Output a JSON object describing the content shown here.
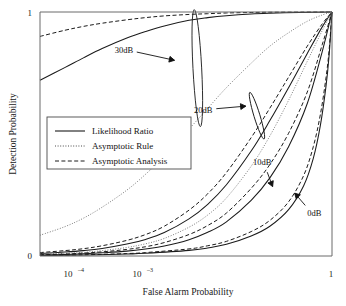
{
  "chart_data": {
    "type": "line",
    "title": "",
    "xlabel": "False Alarm Probability",
    "ylabel": "Detection Probability",
    "xscale": "log",
    "yscale": "linear",
    "xlim": [
      2e-05,
      1
    ],
    "ylim": [
      0,
      1
    ],
    "grid": false,
    "xticks": [
      {
        "value": 0.0001,
        "label": "10",
        "exponent": "–4"
      },
      {
        "value": 0.001,
        "label": "10",
        "exponent": "–3"
      },
      {
        "value": 1,
        "label": "1",
        "exponent": ""
      }
    ],
    "yticks": [
      {
        "value": 0,
        "label": "0"
      },
      {
        "value": 1,
        "label": "1"
      }
    ],
    "legend": {
      "position": "center-left",
      "entries": [
        {
          "name": "Likelihood Ratio",
          "style": "solid"
        },
        {
          "name": "Asymptotic Rule",
          "style": "dotted"
        },
        {
          "name": "Asymptotic Analysis",
          "style": "dashed"
        }
      ]
    },
    "annotations": [
      {
        "text": "30dB",
        "x": 0.00045,
        "y": 0.845,
        "target_x": 0.0032,
        "target_y": 0.8
      },
      {
        "text": "20dB",
        "x": 0.0085,
        "y": 0.6,
        "target_x": 0.045,
        "target_y": 0.615
      },
      {
        "text": "10dB",
        "x": 0.075,
        "y": 0.385,
        "target_x": 0.115,
        "target_y": 0.275
      },
      {
        "text": "0dB",
        "x": 0.52,
        "y": 0.175,
        "target_x": 0.235,
        "target_y": 0.265
      }
    ],
    "markers": [
      {
        "kind": "ellipse",
        "label_for": "30dB",
        "cx": 0.0068,
        "cy": 0.77,
        "rx": 0.07,
        "ry": 0.24,
        "rotation": -3
      },
      {
        "kind": "ellipse",
        "label_for": "20dB",
        "cx": 0.062,
        "cy": 0.575,
        "rx": 0.04,
        "ry": 0.1,
        "rotation": -17
      }
    ],
    "series": [
      {
        "name": "30dB Likelihood Ratio",
        "snr_db": 30,
        "style": "solid",
        "points": [
          [
            2e-05,
            0.72
          ],
          [
            5e-05,
            0.772
          ],
          [
            0.0001,
            0.812
          ],
          [
            0.0002,
            0.85
          ],
          [
            0.0005,
            0.893
          ],
          [
            0.001,
            0.92
          ],
          [
            0.002,
            0.943
          ],
          [
            0.005,
            0.966
          ],
          [
            0.01,
            0.977
          ],
          [
            0.02,
            0.985
          ],
          [
            0.05,
            0.992
          ],
          [
            0.1,
            0.995
          ],
          [
            0.3,
            0.998
          ],
          [
            0.6,
            0.999
          ],
          [
            1.0,
            1.0
          ]
        ]
      },
      {
        "name": "30dB Asymptotic Analysis",
        "snr_db": 30,
        "style": "dashed",
        "points": [
          [
            2e-05,
            0.9
          ],
          [
            5e-05,
            0.925
          ],
          [
            0.0001,
            0.941
          ],
          [
            0.0002,
            0.954
          ],
          [
            0.0005,
            0.968
          ],
          [
            0.001,
            0.977
          ],
          [
            0.002,
            0.984
          ],
          [
            0.005,
            0.99
          ],
          [
            0.01,
            0.993
          ],
          [
            0.02,
            0.996
          ],
          [
            0.05,
            0.998
          ],
          [
            0.1,
            0.999
          ],
          [
            0.3,
            0.9995
          ],
          [
            1.0,
            1.0
          ]
        ]
      },
      {
        "name": "30dB Asymptotic Rule",
        "snr_db": 30,
        "style": "dotted",
        "points": [
          [
            2e-05,
            0.085
          ],
          [
            5e-05,
            0.12
          ],
          [
            0.0001,
            0.155
          ],
          [
            0.0002,
            0.2
          ],
          [
            0.0005,
            0.27
          ],
          [
            0.001,
            0.335
          ],
          [
            0.002,
            0.41
          ],
          [
            0.005,
            0.52
          ],
          [
            0.01,
            0.605
          ],
          [
            0.02,
            0.69
          ],
          [
            0.05,
            0.79
          ],
          [
            0.1,
            0.86
          ],
          [
            0.2,
            0.915
          ],
          [
            0.4,
            0.962
          ],
          [
            0.7,
            0.988
          ],
          [
            1.0,
            1.0
          ]
        ]
      },
      {
        "name": "20dB Likelihood Ratio",
        "snr_db": 20,
        "style": "solid",
        "points": [
          [
            2e-05,
            0.01
          ],
          [
            5e-05,
            0.016
          ],
          [
            0.0001,
            0.022
          ],
          [
            0.0002,
            0.031
          ],
          [
            0.0005,
            0.049
          ],
          [
            0.001,
            0.068
          ],
          [
            0.002,
            0.096
          ],
          [
            0.005,
            0.152
          ],
          [
            0.01,
            0.212
          ],
          [
            0.02,
            0.292
          ],
          [
            0.05,
            0.43
          ],
          [
            0.1,
            0.555
          ],
          [
            0.2,
            0.69
          ],
          [
            0.4,
            0.83
          ],
          [
            0.7,
            0.94
          ],
          [
            1.0,
            1.0
          ]
        ]
      },
      {
        "name": "20dB Asymptotic Analysis",
        "snr_db": 20,
        "style": "dashed",
        "points": [
          [
            2e-05,
            0.014
          ],
          [
            5e-05,
            0.022
          ],
          [
            0.0001,
            0.03
          ],
          [
            0.0002,
            0.042
          ],
          [
            0.0005,
            0.064
          ],
          [
            0.001,
            0.088
          ],
          [
            0.002,
            0.122
          ],
          [
            0.005,
            0.188
          ],
          [
            0.01,
            0.255
          ],
          [
            0.02,
            0.342
          ],
          [
            0.05,
            0.485
          ],
          [
            0.1,
            0.606
          ],
          [
            0.2,
            0.733
          ],
          [
            0.4,
            0.86
          ],
          [
            0.7,
            0.952
          ],
          [
            1.0,
            1.0
          ]
        ]
      },
      {
        "name": "20dB Asymptotic Rule",
        "snr_db": 20,
        "style": "dotted",
        "points": [
          [
            2e-05,
            0.007
          ],
          [
            5e-05,
            0.011
          ],
          [
            0.0001,
            0.015
          ],
          [
            0.0002,
            0.022
          ],
          [
            0.0005,
            0.035
          ],
          [
            0.001,
            0.05
          ],
          [
            0.002,
            0.072
          ],
          [
            0.005,
            0.118
          ],
          [
            0.01,
            0.168
          ],
          [
            0.02,
            0.238
          ],
          [
            0.05,
            0.368
          ],
          [
            0.1,
            0.492
          ],
          [
            0.2,
            0.638
          ],
          [
            0.4,
            0.798
          ],
          [
            0.7,
            0.925
          ],
          [
            1.0,
            1.0
          ]
        ]
      },
      {
        "name": "10dB Likelihood Ratio",
        "snr_db": 10,
        "style": "solid",
        "points": [
          [
            2e-05,
            0.004
          ],
          [
            5e-05,
            0.006
          ],
          [
            0.0001,
            0.009
          ],
          [
            0.0002,
            0.013
          ],
          [
            0.0005,
            0.02
          ],
          [
            0.001,
            0.029
          ],
          [
            0.002,
            0.041
          ],
          [
            0.005,
            0.067
          ],
          [
            0.01,
            0.097
          ],
          [
            0.02,
            0.14
          ],
          [
            0.05,
            0.228
          ],
          [
            0.1,
            0.32
          ],
          [
            0.2,
            0.448
          ],
          [
            0.4,
            0.625
          ],
          [
            0.7,
            0.84
          ],
          [
            1.0,
            1.0
          ]
        ]
      },
      {
        "name": "10dB Asymptotic Analysis",
        "snr_db": 10,
        "style": "dashed",
        "points": [
          [
            2e-05,
            0.005
          ],
          [
            5e-05,
            0.008
          ],
          [
            0.0001,
            0.012
          ],
          [
            0.0002,
            0.017
          ],
          [
            0.0005,
            0.027
          ],
          [
            0.001,
            0.038
          ],
          [
            0.002,
            0.055
          ],
          [
            0.005,
            0.088
          ],
          [
            0.01,
            0.125
          ],
          [
            0.02,
            0.176
          ],
          [
            0.05,
            0.277
          ],
          [
            0.1,
            0.375
          ],
          [
            0.2,
            0.503
          ],
          [
            0.4,
            0.672
          ],
          [
            0.7,
            0.868
          ],
          [
            1.0,
            1.0
          ]
        ]
      },
      {
        "name": "0dB Likelihood Ratio",
        "snr_db": 0,
        "style": "solid",
        "points": [
          [
            2e-05,
            0.002
          ],
          [
            0.0001,
            0.004
          ],
          [
            0.0005,
            0.008
          ],
          [
            0.001,
            0.011
          ],
          [
            0.005,
            0.023
          ],
          [
            0.01,
            0.033
          ],
          [
            0.02,
            0.048
          ],
          [
            0.05,
            0.082
          ],
          [
            0.1,
            0.122
          ],
          [
            0.2,
            0.19
          ],
          [
            0.35,
            0.288
          ],
          [
            0.5,
            0.4
          ],
          [
            0.65,
            0.535
          ],
          [
            0.8,
            0.695
          ],
          [
            0.9,
            0.825
          ],
          [
            1.0,
            1.0
          ]
        ]
      },
      {
        "name": "0dB Asymptotic Analysis",
        "snr_db": 0,
        "style": "dashed",
        "points": [
          [
            2e-05,
            0.003
          ],
          [
            0.0001,
            0.005
          ],
          [
            0.0005,
            0.01
          ],
          [
            0.001,
            0.014
          ],
          [
            0.005,
            0.029
          ],
          [
            0.01,
            0.042
          ],
          [
            0.02,
            0.06
          ],
          [
            0.05,
            0.1
          ],
          [
            0.1,
            0.146
          ],
          [
            0.2,
            0.222
          ],
          [
            0.35,
            0.33
          ],
          [
            0.5,
            0.448
          ],
          [
            0.65,
            0.58
          ],
          [
            0.8,
            0.73
          ],
          [
            0.9,
            0.846
          ],
          [
            1.0,
            1.0
          ]
        ]
      }
    ]
  }
}
